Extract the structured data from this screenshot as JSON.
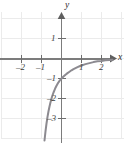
{
  "figure": {
    "background_color": "#ffffff",
    "grid_color": "#ebebeb",
    "axis_color": "#7c7c7c",
    "curve_color": "#8c8a90",
    "label_color": "#3a3a3a"
  },
  "axes": {
    "x_axis_label": "x",
    "y_axis_label": "y",
    "x_ticks": [
      {
        "value": -2,
        "label": "–2"
      },
      {
        "value": -1,
        "label": "–1"
      },
      {
        "value": 1,
        "label": "1"
      },
      {
        "value": 2,
        "label": "2"
      }
    ],
    "y_ticks": [
      {
        "value": 1,
        "label": "1"
      },
      {
        "value": -1,
        "label": "–1"
      },
      {
        "value": -2,
        "label": "–2"
      },
      {
        "value": -3,
        "label": "–3"
      }
    ]
  },
  "chart_data": {
    "type": "line",
    "title": "",
    "subtitle": "",
    "xlabel": "x",
    "ylabel": "y",
    "xlim": [
      -2.9,
      3.1
    ],
    "ylim": [
      -4.1,
      1.7
    ],
    "grid": true,
    "grid_step": 1,
    "legend": "none",
    "annotations": [],
    "series": [
      {
        "name": "curve",
        "description": "increasing concave-down curve through (0, -1), approaching y = 0 asymptotically as x increases, falling steeply below y = -3 near x = -0.85",
        "x": [
          -0.85,
          -0.8,
          -0.75,
          -0.7,
          -0.65,
          -0.6,
          -0.55,
          -0.5,
          -0.45,
          -0.4,
          -0.35,
          -0.3,
          -0.25,
          -0.2,
          -0.15,
          -0.1,
          -0.05,
          0.0,
          0.1,
          0.2,
          0.3,
          0.4,
          0.5,
          0.6,
          0.7,
          0.8,
          0.9,
          1.0,
          1.2,
          1.4,
          1.6,
          1.8,
          2.0,
          2.2,
          2.4,
          2.55
        ],
        "y": [
          -4.1,
          -3.64,
          -3.25,
          -2.92,
          -2.64,
          -2.4,
          -2.19,
          -2.0,
          -1.84,
          -1.7,
          -1.58,
          -1.46,
          -1.36,
          -1.27,
          -1.19,
          -1.12,
          -1.06,
          -1.0,
          -0.9,
          -0.81,
          -0.73,
          -0.66,
          -0.59,
          -0.53,
          -0.48,
          -0.43,
          -0.39,
          -0.35,
          -0.28,
          -0.23,
          -0.18,
          -0.14,
          -0.12,
          -0.09,
          -0.07,
          -0.06
        ]
      }
    ]
  }
}
